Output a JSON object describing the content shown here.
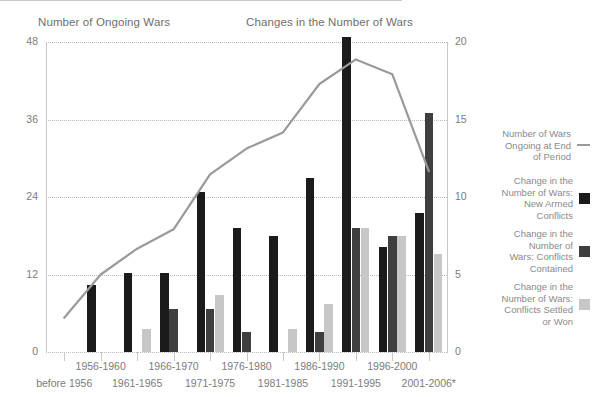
{
  "titles": {
    "left": "Number of Ongoing Wars",
    "right": "Changes in the Number of Wars"
  },
  "axes": {
    "left_ticks": [
      "48",
      "36",
      "24",
      "12",
      "0"
    ],
    "right_ticks": [
      "20",
      "15",
      "10",
      "5",
      "0"
    ]
  },
  "legend": {
    "items": [
      {
        "label": "Number of Wars\nOngoing at End\nof Period",
        "marker": "line",
        "color": "#9a9a9a"
      },
      {
        "label": "Change in the\nNumber of Wars:\nNew Armed\nConflicts",
        "marker": "square",
        "color": "#1b1b1b"
      },
      {
        "label": "Change in the\nNumber of\nWars: Conflicts\nContained",
        "marker": "square",
        "color": "#3f3f3f"
      },
      {
        "label": "Change in the\nNumber of Wars:\nConflicts Settled\nor Won",
        "marker": "square",
        "color": "#c7c7c7"
      }
    ]
  },
  "chart_data": {
    "type": "bar",
    "title": "Changes in the Number of Wars",
    "subtitle": "Number of Ongoing Wars",
    "xlabel": "",
    "ylabel": "Number of Ongoing Wars",
    "ylabel_right": "Changes in the Number of Wars",
    "ylim": [
      0,
      48
    ],
    "ylim_right": [
      0,
      20
    ],
    "grid": true,
    "legend_position": "right",
    "categories": [
      "before 1956",
      "1956-1960",
      "1961-1965",
      "1966-1970",
      "1971-1975",
      "1976-1980",
      "1981-1985",
      "1986-1990",
      "1991-1995",
      "1996-2000",
      "2001-2006*"
    ],
    "series": [
      {
        "name": "Change in the Number of Wars: New Armed Conflicts",
        "type": "bar",
        "axis": "right",
        "color": "#1b1b1b",
        "values": [
          0,
          4.3,
          5.1,
          5.1,
          10.3,
          8.0,
          7.5,
          11.2,
          20.3,
          6.8,
          9.0
        ]
      },
      {
        "name": "Change in the Number of Wars: Conflicts Contained",
        "type": "bar",
        "axis": "right",
        "color": "#3f3f3f",
        "values": [
          0,
          0,
          0,
          2.8,
          2.8,
          1.3,
          0,
          1.3,
          8.0,
          7.5,
          15.4
        ]
      },
      {
        "name": "Change in the Number of Wars: Conflicts Settled or Won",
        "type": "bar",
        "axis": "right",
        "color": "#c7c7c7",
        "values": [
          0,
          0,
          1.5,
          0,
          3.7,
          0,
          1.5,
          3.1,
          8.0,
          7.5,
          6.3
        ]
      },
      {
        "name": "Number of Wars Ongoing at End of Period",
        "type": "line",
        "axis": "left",
        "color": "#9a9a9a",
        "values": [
          5.3,
          12.0,
          16.0,
          19.0,
          27.5,
          31.5,
          34.0,
          41.5,
          45.3,
          43.0,
          28.0
        ]
      }
    ]
  }
}
